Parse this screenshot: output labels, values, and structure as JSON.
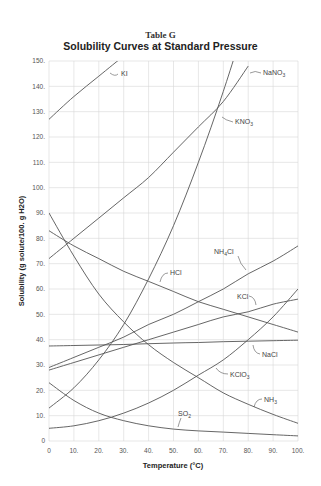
{
  "header": {
    "table_label": "Table G",
    "title": "Solubility Curves at Standard Pressure"
  },
  "chart_data": {
    "type": "line",
    "title": "Solubility Curves at Standard Pressure",
    "subtitle": "Table G",
    "xlabel": "Temperature (°C)",
    "ylabel": "Solubility (g solute/100. g H2O)",
    "xlim": [
      0,
      100
    ],
    "ylim": [
      0,
      150
    ],
    "grid": true,
    "legend_position": "inline labels",
    "x_ticks": [
      "0",
      "10.",
      "20.",
      "30.",
      "40.",
      "50.",
      "60.",
      "70.",
      "80.",
      "90.",
      "100."
    ],
    "y_ticks": [
      "0",
      "10.",
      "20.",
      "30.",
      "40.",
      "50.",
      "60.",
      "70.",
      "80.",
      "90.",
      "100.",
      "110.",
      "120.",
      "130.",
      "140.",
      "150."
    ],
    "x": [
      0,
      10,
      20,
      30,
      40,
      50,
      60,
      70,
      80,
      90,
      100
    ],
    "series": [
      {
        "name": "KI",
        "values": [
          127,
          136,
          144,
          152,
          null,
          null,
          null,
          null,
          null,
          null,
          null
        ]
      },
      {
        "name": "NaNO3",
        "values": [
          72,
          80,
          88,
          96,
          104,
          114,
          124,
          134,
          148,
          null,
          null
        ]
      },
      {
        "name": "KNO3",
        "values": [
          13,
          21,
          32,
          46,
          64,
          85,
          110,
          138,
          169,
          null,
          null
        ]
      },
      {
        "name": "NH4Cl",
        "values": [
          29,
          33,
          37,
          41,
          46,
          50,
          55,
          60,
          66,
          71,
          77
        ]
      },
      {
        "name": "KCl",
        "values": [
          28,
          31,
          34,
          37,
          40,
          43,
          46,
          49,
          51,
          54,
          56
        ]
      },
      {
        "name": "NaCl",
        "values": [
          37.5,
          37.7,
          37.9,
          38.1,
          38.4,
          38.7,
          38.9,
          39.2,
          39.4,
          39.6,
          39.8
        ]
      },
      {
        "name": "KClO3",
        "values": [
          5,
          6,
          8,
          11,
          15,
          20,
          26,
          32,
          40,
          49,
          60
        ]
      },
      {
        "name": "HCl",
        "values": [
          83,
          77,
          72,
          67,
          63,
          59,
          55,
          52,
          49,
          46,
          43
        ]
      },
      {
        "name": "NH3",
        "values": [
          90,
          73,
          58,
          47,
          38,
          31,
          25,
          19,
          14.5,
          10.5,
          7
        ]
      },
      {
        "name": "SO2",
        "values": [
          23,
          16,
          11,
          8,
          6,
          4.7,
          4,
          3.5,
          3,
          2.5,
          2
        ]
      }
    ],
    "series_labels": [
      {
        "name": "KI",
        "text": "KI"
      },
      {
        "name": "NaNO3",
        "text": "NaNO",
        "sub": "3"
      },
      {
        "name": "KNO3",
        "text": "KNO",
        "sub": "3"
      },
      {
        "name": "NH4Cl",
        "text": "NH",
        "sub": "4",
        "tail": "Cl"
      },
      {
        "name": "KCl",
        "text": "KCl"
      },
      {
        "name": "HCl",
        "text": "HCl"
      },
      {
        "name": "NaCl",
        "text": "NaCl"
      },
      {
        "name": "KClO3",
        "text": "KClO",
        "sub": "3"
      },
      {
        "name": "NH3",
        "text": "NH",
        "sub": "3"
      },
      {
        "name": "SO2",
        "text": "SO",
        "sub": "2"
      }
    ]
  }
}
